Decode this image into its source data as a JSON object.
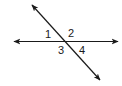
{
  "diagram": {
    "type": "intersecting-lines",
    "colors": {
      "line": "#1a1a1a",
      "background": "#ffffff"
    },
    "lines": [
      {
        "name": "horizontal-line",
        "from": [
          14,
          41
        ],
        "to": [
          118,
          42
        ]
      },
      {
        "name": "transversal-line",
        "from": [
          32,
          5
        ],
        "to": [
          100,
          80
        ]
      }
    ],
    "angles": [
      {
        "label": "1",
        "x": 45,
        "y": 38
      },
      {
        "label": "2",
        "x": 68,
        "y": 37
      },
      {
        "label": "3",
        "x": 58,
        "y": 54
      },
      {
        "label": "4",
        "x": 79,
        "y": 54
      }
    ]
  }
}
